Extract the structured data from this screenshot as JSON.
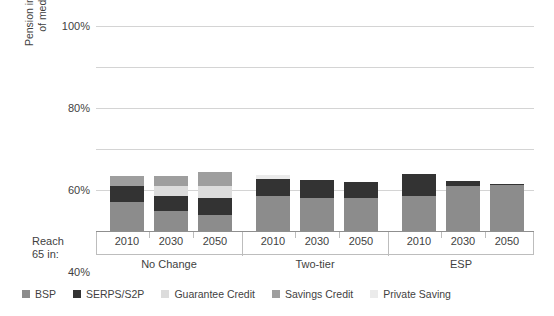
{
  "chart_data": {
    "type": "bar",
    "subtype": "stacked-grouped-column",
    "title": "",
    "xlabel": "Reach 65 in:",
    "ylabel": "Pension income as percentage of median earnings at 75",
    "ylabel_lines": [
      "Pension income as percentage",
      "of median earnings at 75"
    ],
    "ylim": [
      0,
      100
    ],
    "yticks": [
      0,
      20,
      40,
      60,
      80,
      100
    ],
    "ytick_labels": [
      "0%",
      "20%",
      "40%",
      "60%",
      "80%",
      "100%"
    ],
    "grid": true,
    "legend_position": "bottom",
    "groups": [
      "No Change",
      "Two-tier",
      "ESP"
    ],
    "categories": [
      "2010",
      "2030",
      "2050",
      "2010",
      "2030",
      "2050",
      "2010",
      "2030",
      "2050"
    ],
    "series": [
      {
        "name": "BSP",
        "color": "#8c8c8c",
        "values": [
          14.0,
          10.0,
          8.0,
          17.0,
          16.0,
          16.0,
          17.0,
          22.0,
          22.5
        ]
      },
      {
        "name": "SERPS/S2P",
        "color": "#333333",
        "values": [
          8.0,
          7.0,
          8.0,
          8.5,
          9.0,
          8.0,
          11.0,
          2.5,
          0.6
        ]
      },
      {
        "name": "Guarantee Credit",
        "color": "#dcdcdc",
        "values": [
          0.0,
          5.0,
          6.0,
          0.0,
          0.0,
          0.0,
          0.0,
          0.0,
          0.0
        ]
      },
      {
        "name": "Savings Credit",
        "color": "#9e9e9e",
        "values": [
          5.0,
          5.0,
          7.0,
          0.0,
          0.0,
          0.0,
          0.0,
          0.0,
          0.0
        ]
      },
      {
        "name": "Private Saving",
        "color": "#ebebeb",
        "values": [
          0.0,
          0.0,
          0.0,
          1.8,
          0.0,
          0.0,
          0.0,
          0.0,
          0.0
        ]
      }
    ],
    "totals": [
      27.0,
      27.0,
      29.0,
      27.3,
      25.0,
      24.0,
      28.0,
      24.5,
      23.1
    ]
  },
  "legend": {
    "items": [
      {
        "label": "BSP",
        "color": "#8c8c8c"
      },
      {
        "label": "SERPS/S2P",
        "color": "#333333"
      },
      {
        "label": "Guarantee Credit",
        "color": "#dcdcdc"
      },
      {
        "label": "Savings Credit",
        "color": "#9e9e9e"
      },
      {
        "label": "Private Saving",
        "color": "#ebebeb"
      }
    ]
  },
  "axis": {
    "reach_line1": "Reach",
    "reach_line2": "65 in:"
  },
  "colors": {
    "gridline": "#d4d4d4",
    "baseline": "#8f8f8f",
    "text": "#3f3f3f",
    "background": "#ffffff"
  }
}
